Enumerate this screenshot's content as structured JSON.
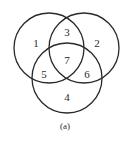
{
  "diagram": {
    "type": "venn-3-set",
    "caption": "(a)",
    "stroke_color": "#2a2a2a",
    "circles": [
      {
        "id": "left",
        "cx": 49,
        "cy": 48,
        "r": 35
      },
      {
        "id": "right",
        "cx": 84,
        "cy": 48,
        "r": 35
      },
      {
        "id": "bottom",
        "cx": 67,
        "cy": 78,
        "r": 35
      }
    ],
    "regions": [
      {
        "label": "1",
        "x": 36,
        "y": 44,
        "description": "left only"
      },
      {
        "label": "2",
        "x": 97,
        "y": 44,
        "description": "right only"
      },
      {
        "label": "3",
        "x": 67,
        "y": 33,
        "description": "left and right"
      },
      {
        "label": "4",
        "x": 67,
        "y": 98,
        "description": "bottom only"
      },
      {
        "label": "5",
        "x": 44,
        "y": 75,
        "description": "left and bottom"
      },
      {
        "label": "6",
        "x": 87,
        "y": 75,
        "description": "right and bottom"
      },
      {
        "label": "7",
        "x": 67,
        "y": 61,
        "description": "all three"
      }
    ],
    "caption_pos": {
      "x": 65,
      "y": 127
    }
  }
}
